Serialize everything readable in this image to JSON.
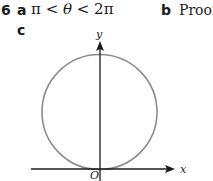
{
  "question": {
    "number": "6",
    "parts": [
      {
        "label": "a",
        "answer_parts": [
          "π",
          " < ",
          "θ",
          " < 2π"
        ]
      },
      {
        "label": "b",
        "answer": "Proof"
      },
      {
        "label": "c",
        "answer": ""
      }
    ]
  },
  "figure": {
    "type": "diagram",
    "axes": {
      "x_label": "x",
      "y_label": "y",
      "origin_label": "O"
    },
    "colors": {
      "axis": "#1a1a1a",
      "circle": "#8c8c8c"
    }
  }
}
